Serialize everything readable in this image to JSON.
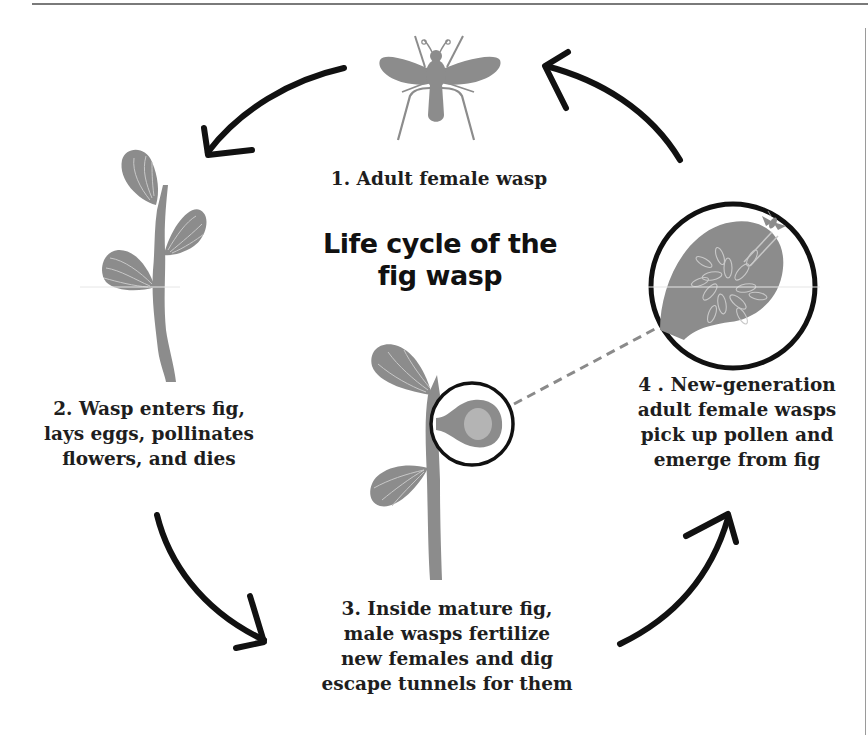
{
  "title": {
    "line1": "Life cycle of the",
    "line2": "fig wasp"
  },
  "steps": [
    {
      "number": "1",
      "lines": [
        "1. Adult female wasp"
      ],
      "illustration": "wasp-icon"
    },
    {
      "number": "2",
      "lines": [
        "2. Wasp enters fig,",
        "lays eggs, pollinates",
        "flowers, and dies"
      ],
      "illustration": "fig-branch-icon"
    },
    {
      "number": "3",
      "lines": [
        "3. Inside mature fig,",
        "male wasps fertilize",
        "new females and dig",
        "escape tunnels for them"
      ],
      "illustration": "fig-branch-with-magnified-fig-icon"
    },
    {
      "number": "4",
      "lines": [
        "4 . New-generation",
        "adult female wasps",
        "pick up pollen and",
        "emerge from fig"
      ],
      "illustration": "magnified-fig-cross-section-icon"
    }
  ],
  "arrows": [
    {
      "from": "1",
      "to": "2",
      "direction": "counter-clockwise"
    },
    {
      "from": "2",
      "to": "3",
      "direction": "counter-clockwise"
    },
    {
      "from": "3",
      "to": "4",
      "direction": "counter-clockwise"
    },
    {
      "from": "4",
      "to": "1",
      "direction": "counter-clockwise"
    }
  ],
  "colors": {
    "illustration_gray": "#8c8c8c",
    "vein_light": "#c8c8c8",
    "arrow_black": "#111111",
    "text": "#1e1e1e",
    "dashed_connector": "#8a8a8a"
  }
}
